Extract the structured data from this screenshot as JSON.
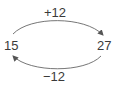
{
  "diagram": {
    "nodes": [
      {
        "id": "left",
        "label": "15"
      },
      {
        "id": "right",
        "label": "27"
      }
    ],
    "edges": [
      {
        "from": "15",
        "to": "27",
        "label": "+12",
        "position": "top"
      },
      {
        "from": "27",
        "to": "15",
        "label": "−12",
        "position": "bottom"
      }
    ],
    "colors": {
      "stroke": "#555555",
      "text": "#3a3a3a",
      "background": "#ffffff"
    }
  }
}
